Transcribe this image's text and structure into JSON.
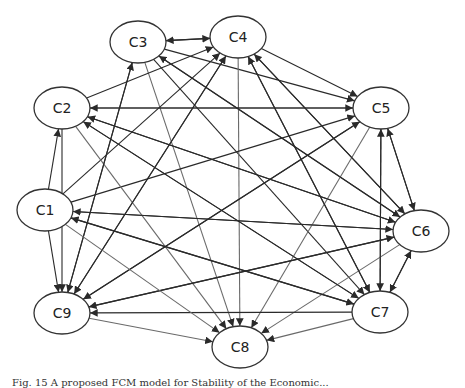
{
  "diagram": {
    "type": "directed-graph",
    "colors": {
      "edge": "#2a2a2a",
      "edge_light": "#6a6a6a",
      "node_stroke": "#333333",
      "node_fill": "#ffffff"
    },
    "nodes": [
      {
        "id": "C1",
        "label": "C1",
        "x": 45,
        "y": 210
      },
      {
        "id": "C2",
        "label": "C2",
        "x": 62,
        "y": 108
      },
      {
        "id": "C3",
        "label": "C3",
        "x": 138,
        "y": 42
      },
      {
        "id": "C4",
        "label": "C4",
        "x": 238,
        "y": 37
      },
      {
        "id": "C5",
        "label": "C5",
        "x": 381,
        "y": 108
      },
      {
        "id": "C6",
        "label": "C6",
        "x": 421,
        "y": 231
      },
      {
        "id": "C7",
        "label": "C7",
        "x": 380,
        "y": 312
      },
      {
        "id": "C8",
        "label": "C8",
        "x": 240,
        "y": 347
      },
      {
        "id": "C9",
        "label": "C9",
        "x": 62,
        "y": 313
      }
    ],
    "edges": [
      [
        "C4",
        "C3"
      ],
      [
        "C3",
        "C4"
      ],
      [
        "C3",
        "C5"
      ],
      [
        "C3",
        "C6"
      ],
      [
        "C3",
        "C7"
      ],
      [
        "C3",
        "C9"
      ],
      [
        "C3",
        "C8"
      ],
      [
        "C4",
        "C5"
      ],
      [
        "C4",
        "C6"
      ],
      [
        "C4",
        "C9"
      ],
      [
        "C4",
        "C8"
      ],
      [
        "C4",
        "C7"
      ],
      [
        "C1",
        "C2"
      ],
      [
        "C1",
        "C4"
      ],
      [
        "C1",
        "C5"
      ],
      [
        "C1",
        "C6"
      ],
      [
        "C1",
        "C7"
      ],
      [
        "C2",
        "C4"
      ],
      [
        "C2",
        "C5"
      ],
      [
        "C2",
        "C6"
      ],
      [
        "C2",
        "C7"
      ],
      [
        "C2",
        "C8"
      ],
      [
        "C2",
        "C9"
      ],
      [
        "C5",
        "C6"
      ],
      [
        "C6",
        "C5"
      ],
      [
        "C5",
        "C7"
      ],
      [
        "C5",
        "C9"
      ],
      [
        "C5",
        "C8"
      ],
      [
        "C5",
        "C2"
      ],
      [
        "C6",
        "C1"
      ],
      [
        "C6",
        "C2"
      ],
      [
        "C6",
        "C3"
      ],
      [
        "C6",
        "C9"
      ],
      [
        "C6",
        "C7"
      ],
      [
        "C6",
        "C8"
      ],
      [
        "C6",
        "C4"
      ],
      [
        "C7",
        "C4"
      ],
      [
        "C7",
        "C5"
      ],
      [
        "C7",
        "C9"
      ],
      [
        "C7",
        "C8"
      ],
      [
        "C7",
        "C1"
      ],
      [
        "C7",
        "C6"
      ],
      [
        "C7",
        "C2"
      ],
      [
        "C9",
        "C3"
      ],
      [
        "C9",
        "C4"
      ],
      [
        "C9",
        "C5"
      ],
      [
        "C9",
        "C8"
      ],
      [
        "C9",
        "C6"
      ],
      [
        "C1",
        "C8"
      ],
      [
        "C1",
        "C9"
      ]
    ]
  },
  "caption": "Fig. 15 A proposed FCM model for Stability of the Economic..."
}
